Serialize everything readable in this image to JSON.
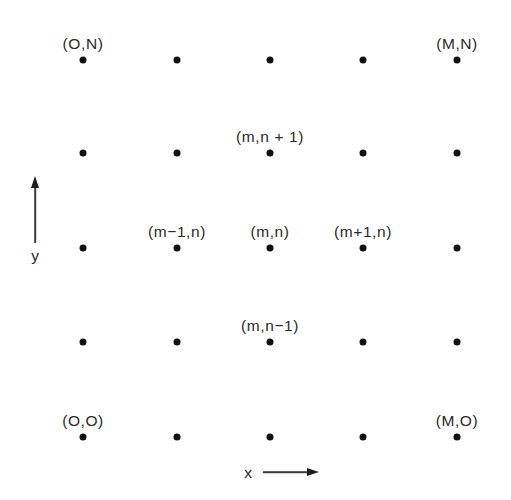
{
  "figure": {
    "width": 511,
    "height": 500,
    "background_color": "#ffffff",
    "dot_color": "#101010",
    "text_color": "#2a2a2a",
    "axis_color": "#3a3a3a"
  },
  "chart_data": {
    "type": "scatter",
    "title": "",
    "subtitle": "",
    "xlabel": "x",
    "ylabel": "y",
    "grid": false,
    "legend": null,
    "xlim": [
      83,
      457
    ],
    "ylim": [
      60,
      437
    ],
    "columns_px": [
      83,
      177,
      270,
      363,
      457
    ],
    "rows_px": [
      60,
      153,
      248,
      342,
      437
    ],
    "points": [
      {
        "col": 0,
        "row": 0,
        "x": 83,
        "y": 60,
        "label": "(O,N)"
      },
      {
        "col": 1,
        "row": 0,
        "x": 177,
        "y": 60,
        "label": ""
      },
      {
        "col": 2,
        "row": 0,
        "x": 270,
        "y": 60,
        "label": ""
      },
      {
        "col": 3,
        "row": 0,
        "x": 363,
        "y": 60,
        "label": ""
      },
      {
        "col": 4,
        "row": 0,
        "x": 457,
        "y": 60,
        "label": "(M,N)"
      },
      {
        "col": 0,
        "row": 1,
        "x": 83,
        "y": 153,
        "label": ""
      },
      {
        "col": 1,
        "row": 1,
        "x": 177,
        "y": 153,
        "label": ""
      },
      {
        "col": 2,
        "row": 1,
        "x": 270,
        "y": 153,
        "label": "(m,n + 1)"
      },
      {
        "col": 3,
        "row": 1,
        "x": 363,
        "y": 153,
        "label": ""
      },
      {
        "col": 4,
        "row": 1,
        "x": 457,
        "y": 153,
        "label": ""
      },
      {
        "col": 0,
        "row": 2,
        "x": 83,
        "y": 248,
        "label": ""
      },
      {
        "col": 1,
        "row": 2,
        "x": 177,
        "y": 248,
        "label": "(m−1,n)"
      },
      {
        "col": 2,
        "row": 2,
        "x": 270,
        "y": 248,
        "label": "(m,n)"
      },
      {
        "col": 3,
        "row": 2,
        "x": 363,
        "y": 248,
        "label": "(m+1,n)"
      },
      {
        "col": 4,
        "row": 2,
        "x": 457,
        "y": 248,
        "label": ""
      },
      {
        "col": 0,
        "row": 3,
        "x": 83,
        "y": 342,
        "label": ""
      },
      {
        "col": 1,
        "row": 3,
        "x": 177,
        "y": 342,
        "label": ""
      },
      {
        "col": 2,
        "row": 3,
        "x": 270,
        "y": 342,
        "label": "(m,n−1)"
      },
      {
        "col": 3,
        "row": 3,
        "x": 363,
        "y": 342,
        "label": ""
      },
      {
        "col": 4,
        "row": 3,
        "x": 457,
        "y": 342,
        "label": ""
      },
      {
        "col": 0,
        "row": 4,
        "x": 83,
        "y": 437,
        "label": "(O,O)"
      },
      {
        "col": 1,
        "row": 4,
        "x": 177,
        "y": 437,
        "label": ""
      },
      {
        "col": 2,
        "row": 4,
        "x": 270,
        "y": 437,
        "label": ""
      },
      {
        "col": 3,
        "row": 4,
        "x": 363,
        "y": 437,
        "label": ""
      },
      {
        "col": 4,
        "row": 4,
        "x": 457,
        "y": 437,
        "label": "(M,O)"
      }
    ],
    "annotations": [
      {
        "name": "corner-bottom-left",
        "text": "(O,O)",
        "x": 83,
        "y": 437
      },
      {
        "name": "corner-bottom-right",
        "text": "(M,O)",
        "x": 457,
        "y": 437
      },
      {
        "name": "corner-top-left",
        "text": "(O,N)",
        "x": 83,
        "y": 60
      },
      {
        "name": "corner-top-right",
        "text": "(M,N)",
        "x": 457,
        "y": 60
      },
      {
        "name": "node-up",
        "text": "(m,n + 1)",
        "x": 270,
        "y": 153
      },
      {
        "name": "node-left",
        "text": "(m−1,n)",
        "x": 177,
        "y": 248
      },
      {
        "name": "node-center",
        "text": "(m,n)",
        "x": 270,
        "y": 248
      },
      {
        "name": "node-right",
        "text": "(m+1,n)",
        "x": 363,
        "y": 248
      },
      {
        "name": "node-down",
        "text": "(m,n−1)",
        "x": 270,
        "y": 342
      }
    ]
  },
  "axes": {
    "y": {
      "label": "y",
      "arrow_direction": "up",
      "shaft_x": 35,
      "shaft_top": 187,
      "shaft_bottom": 243,
      "label_x": 35,
      "label_y": 248
    },
    "x": {
      "label": "x",
      "arrow_direction": "right",
      "shaft_y": 472,
      "shaft_left": 263,
      "shaft_right": 308,
      "label_x": 248,
      "label_y": 465
    }
  }
}
